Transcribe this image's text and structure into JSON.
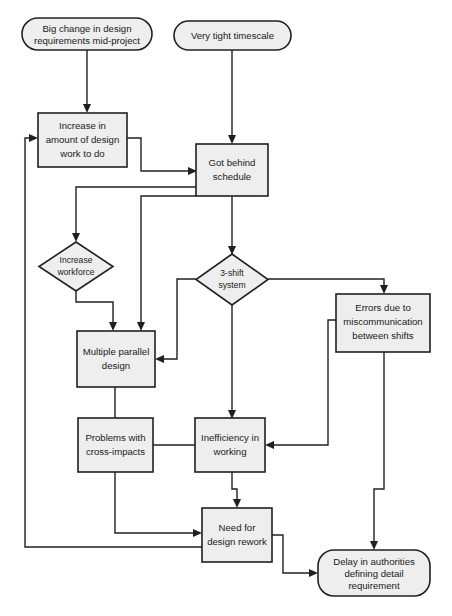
{
  "diagram": {
    "canvas": {
      "width": 452,
      "height": 616
    },
    "style": {
      "node_fill": "#eeeeee",
      "node_stroke": "#231f20",
      "edge_stroke": "#231f20",
      "background": "#ffffff"
    }
  },
  "nodes": {
    "big_change": {
      "id": "big-change-in-design-requirements",
      "shape": "rounded-terminator",
      "line1": "Big change in design",
      "line2": "requirements mid-project"
    },
    "tight_timescale": {
      "id": "very-tight-timescale",
      "shape": "rounded-terminator",
      "line1": "Very tight timescale",
      "line2": ""
    },
    "increase_design": {
      "id": "increase-in-amount-of-design-work",
      "shape": "rectangle",
      "line1": "Increase in",
      "line2": "amount of design",
      "line3": "work to do"
    },
    "got_behind": {
      "id": "got-behind-schedule",
      "shape": "rectangle",
      "line1": "Got behind",
      "line2": "schedule"
    },
    "increase_workforce": {
      "id": "increase-workforce",
      "shape": "diamond",
      "line1": "Increase",
      "line2": "workforce"
    },
    "three_shift": {
      "id": "3-shift-system",
      "shape": "diamond",
      "line1": "3-shift",
      "line2": "system"
    },
    "errors": {
      "id": "errors-due-to-miscommunication",
      "shape": "rectangle",
      "line1": "Errors due to",
      "line2": "miscommunication",
      "line3": "between shifts"
    },
    "multiple_parallel": {
      "id": "multiple-parallel-design",
      "shape": "rectangle",
      "line1": "Multiple parallel",
      "line2": "design"
    },
    "problems_cross": {
      "id": "problems-with-cross-impacts",
      "shape": "rectangle",
      "line1": "Problems with",
      "line2": "cross-impacts"
    },
    "inefficiency": {
      "id": "inefficiency-in-working",
      "shape": "rectangle",
      "line1": "Inefficiency in",
      "line2": "working"
    },
    "need_rework": {
      "id": "need-for-design-rework",
      "shape": "rectangle",
      "line1": "Need for",
      "line2": "design rework"
    },
    "delay_authorities": {
      "id": "delay-in-authorities-defining-detail-requirement",
      "shape": "rounded-terminator",
      "line1": "Delay in authorities",
      "line2": "defining detail",
      "line3": "requirement"
    }
  },
  "edges": [
    {
      "from": "big_change",
      "to": "increase_design"
    },
    {
      "from": "tight_timescale",
      "to": "got_behind"
    },
    {
      "from": "increase_design",
      "to": "got_behind"
    },
    {
      "from": "got_behind",
      "to": "increase_workforce"
    },
    {
      "from": "got_behind",
      "to": "three_shift"
    },
    {
      "from": "got_behind",
      "to": "multiple_parallel"
    },
    {
      "from": "increase_workforce",
      "to": "multiple_parallel"
    },
    {
      "from": "three_shift",
      "to": "multiple_parallel"
    },
    {
      "from": "three_shift",
      "to": "errors"
    },
    {
      "from": "three_shift",
      "to": "inefficiency"
    },
    {
      "from": "errors",
      "to": "inefficiency"
    },
    {
      "from": "errors",
      "to": "delay_authorities"
    },
    {
      "from": "multiple_parallel",
      "to": "problems_cross"
    },
    {
      "from": "problems_cross",
      "to": "inefficiency"
    },
    {
      "from": "problems_cross",
      "to": "need_rework"
    },
    {
      "from": "inefficiency",
      "to": "need_rework"
    },
    {
      "from": "need_rework",
      "to": "delay_authorities"
    },
    {
      "from": "need_rework",
      "to": "increase_design"
    }
  ]
}
